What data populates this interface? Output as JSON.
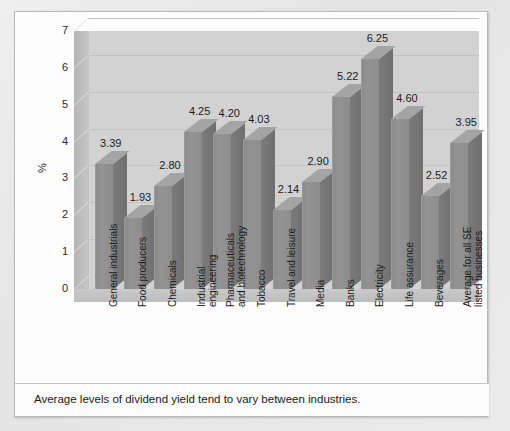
{
  "caption": "Average levels of dividend yield tend to vary between industries.",
  "chart_data": {
    "type": "bar",
    "title": "",
    "xlabel": "",
    "ylabel": "%",
    "ylim": [
      0,
      7
    ],
    "yticks": [
      0,
      1,
      2,
      3,
      4,
      5,
      6,
      7
    ],
    "ytick_labels": [
      "0",
      "1",
      "2",
      "3",
      "4",
      "5",
      "6",
      "7"
    ],
    "grid": true,
    "legend": "none",
    "style": "3d-bar",
    "categories": [
      "General industrials",
      "Food producers",
      "Chemicals",
      "Industrial engineering",
      "Pharmaceuticals and biotechnology",
      "Tobacco",
      "Travel and leisure",
      "Media",
      "Banks",
      "Electricity",
      "Life assurance",
      "Beverages",
      "Average for all SE listed businesses"
    ],
    "category_lines": [
      [
        "General industrials"
      ],
      [
        "Food producers"
      ],
      [
        "Chemicals"
      ],
      [
        "Industrial",
        "engineering"
      ],
      [
        "Pharmaceuticals",
        "and biotechnology"
      ],
      [
        "Tobacco"
      ],
      [
        "Travel and leisure"
      ],
      [
        "Media"
      ],
      [
        "Banks"
      ],
      [
        "Electricity"
      ],
      [
        "Life assurance"
      ],
      [
        "Beverages"
      ],
      [
        "Average for all SE",
        "listed businesses"
      ]
    ],
    "values": [
      3.39,
      1.93,
      2.8,
      4.25,
      4.2,
      4.03,
      2.14,
      2.9,
      5.22,
      6.25,
      4.6,
      2.52,
      3.95
    ],
    "value_labels": [
      "3.39",
      "1.93",
      "2.80",
      "4.25",
      "4.20",
      "4.03",
      "2.14",
      "2.90",
      "5.22",
      "6.25",
      "4.60",
      "2.52",
      "3.95"
    ]
  },
  "colors": {
    "bar_front": "#8f8f8f",
    "bar_side": "#747474",
    "bar_top": "#a4a4a4",
    "plot_background": "#d2d2d2",
    "gridline": "#c2c2c2",
    "panel_background": "#fdfdfd",
    "page_background": "#e9e9e9",
    "text": "#1c1c1c"
  }
}
